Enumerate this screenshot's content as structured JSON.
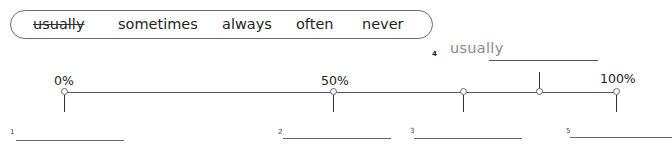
{
  "word_box": {
    "words": [
      {
        "text": "usually",
        "struck": true
      },
      {
        "text": "sometimes",
        "struck": false
      },
      {
        "text": "always",
        "struck": false
      },
      {
        "text": "often",
        "struck": false
      },
      {
        "text": "never",
        "struck": false
      }
    ]
  },
  "scale": {
    "labels": [
      {
        "text": "0%",
        "position": 0
      },
      {
        "text": "50%",
        "position": 50
      },
      {
        "text": "100%",
        "position": 100
      }
    ],
    "markers": [
      {
        "number": "1",
        "position": 0,
        "tick": "below"
      },
      {
        "number": "2",
        "position": 50,
        "tick": "below"
      },
      {
        "number": "3",
        "position": 73,
        "tick": "below"
      },
      {
        "number": "4",
        "position": 86,
        "tick": "above"
      },
      {
        "number": "5",
        "position": 100,
        "tick": "below"
      }
    ]
  },
  "example": {
    "number": "4",
    "answer": "usually"
  },
  "blanks": [
    {
      "number": "1",
      "value": ""
    },
    {
      "number": "2",
      "value": ""
    },
    {
      "number": "3",
      "value": ""
    },
    {
      "number": "5",
      "value": ""
    }
  ]
}
